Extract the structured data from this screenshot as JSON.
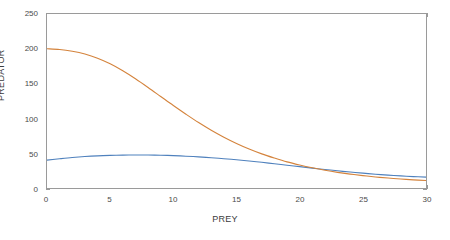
{
  "chart_data": {
    "type": "line",
    "title": "",
    "xlabel": "PREY",
    "ylabel": "PREDATOR",
    "xlim": [
      0,
      30
    ],
    "ylim": [
      0,
      250
    ],
    "xticks": [
      0,
      5,
      10,
      15,
      20,
      25,
      30
    ],
    "yticks": [
      0,
      50,
      100,
      150,
      200,
      250
    ],
    "xtick_labels": [
      "0",
      "5",
      "10",
      "15",
      "20",
      "25",
      "30"
    ],
    "ytick_labels": [
      "0",
      "50",
      "100",
      "150",
      "200",
      "250"
    ],
    "grid": false,
    "legend": false,
    "legend_position": "none",
    "series": [
      {
        "name": "prey-nullcline",
        "color": "#4f81bd",
        "x": [
          0,
          1,
          2,
          3,
          4,
          5,
          6,
          7,
          8,
          9,
          10,
          11,
          12,
          13,
          14,
          15,
          16,
          17,
          18,
          19,
          20,
          21,
          22,
          23,
          24,
          25,
          26,
          27,
          28,
          29,
          30
        ],
        "values": [
          40,
          42,
          43.8,
          45.2,
          46.2,
          46.9,
          47.3,
          47.5,
          47.4,
          47.1,
          46.5,
          45.7,
          44.7,
          43.5,
          42.1,
          40.5,
          38.8,
          36.9,
          34.9,
          32.8,
          30.7,
          28.6,
          26.6,
          24.7,
          22.9,
          21.3,
          19.8,
          18.5,
          17.4,
          16.4,
          15.6
        ]
      },
      {
        "name": "predator-nullcline",
        "color": "#d4833c",
        "x": [
          0,
          1,
          2,
          3,
          4,
          5,
          6,
          7,
          8,
          9,
          10,
          11,
          12,
          13,
          14,
          15,
          16,
          17,
          18,
          19,
          20,
          21,
          22,
          23,
          24,
          25,
          26,
          27,
          28,
          29,
          30
        ],
        "values": [
          200,
          199,
          196.5,
          192.5,
          186.5,
          178.5,
          168.5,
          157,
          144.5,
          131.5,
          118.5,
          106,
          94,
          83,
          73,
          64,
          56,
          49,
          43,
          37.5,
          33,
          29,
          25.5,
          22.5,
          20,
          17.8,
          15.9,
          14.3,
          12.9,
          11.7,
          10.7
        ]
      }
    ],
    "annotations": []
  },
  "figure": {
    "background_color": "#ffffff",
    "axis_color": "#9a9a9a",
    "tick_text_color": "#4a4a4a",
    "label_text_color": "#3c3c3c"
  }
}
